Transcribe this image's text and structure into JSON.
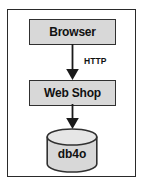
{
  "diagram": {
    "frame": {
      "border_color": "#2a2a2a",
      "background_color": "#ffffff"
    },
    "nodes": [
      {
        "id": "browser",
        "label": "Browser",
        "shape": "rectangle",
        "fill_color": "#d8d8d8",
        "border_color": "#303030"
      },
      {
        "id": "webshop",
        "label": "Web Shop",
        "shape": "rectangle",
        "fill_color": "#d8d8d8",
        "border_color": "#303030"
      },
      {
        "id": "db4o",
        "label": "db4o",
        "shape": "cylinder",
        "fill_color": "#d8d8d8",
        "border_color": "#303030"
      }
    ],
    "edges": [
      {
        "id": "browser-to-webshop",
        "from": "browser",
        "to": "webshop",
        "label": "HTTP",
        "arrow": "down",
        "color": "#1a1a1a"
      },
      {
        "id": "webshop-to-db4o",
        "from": "webshop",
        "to": "db4o",
        "label": "",
        "arrow": "down",
        "color": "#1a1a1a"
      }
    ]
  }
}
